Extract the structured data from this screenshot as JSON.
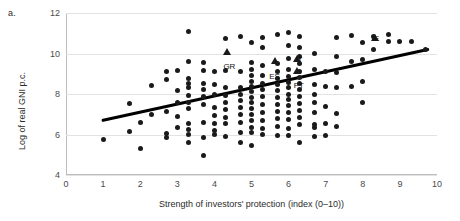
{
  "panel": {
    "label": "a."
  },
  "chart_data": {
    "type": "scatter",
    "title": "",
    "xlabel": "Strength of investors' protection (index (0–10))",
    "ylabel": "Log of real GNI p.c.",
    "xlim": [
      0,
      10
    ],
    "ylim": [
      4,
      12
    ],
    "xticks": [
      "0",
      "1",
      "2",
      "3",
      "4",
      "5",
      "6",
      "7",
      "8",
      "9",
      "10"
    ],
    "yticks": [
      "4",
      "6",
      "8",
      "10",
      "12"
    ],
    "grid": "horizontal",
    "legend": "none",
    "series": [
      {
        "name": "countries",
        "marker": "circle",
        "color": "#1a1a1a",
        "points": [
          [
            1.0,
            5.75
          ],
          [
            1.7,
            6.15
          ],
          [
            1.7,
            7.55
          ],
          [
            2.0,
            5.3
          ],
          [
            2.3,
            8.4
          ],
          [
            2.7,
            8.7
          ],
          [
            2.7,
            6.05
          ],
          [
            2.7,
            5.85
          ],
          [
            3.0,
            9.15
          ],
          [
            3.0,
            7.6
          ],
          [
            3.0,
            6.9
          ],
          [
            3.0,
            6.35
          ],
          [
            3.3,
            11.1
          ],
          [
            3.3,
            9.6
          ],
          [
            3.3,
            8.75
          ],
          [
            3.3,
            8.5
          ],
          [
            3.3,
            8.3
          ],
          [
            3.3,
            7.95
          ],
          [
            3.3,
            7.6
          ],
          [
            3.3,
            7.3
          ],
          [
            3.3,
            6.55
          ],
          [
            3.3,
            6.25
          ],
          [
            3.3,
            6.0
          ],
          [
            3.7,
            9.15
          ],
          [
            3.7,
            8.5
          ],
          [
            3.7,
            8.2
          ],
          [
            3.7,
            7.9
          ],
          [
            3.7,
            7.5
          ],
          [
            3.7,
            6.6
          ],
          [
            3.7,
            5.85
          ],
          [
            3.7,
            4.95
          ],
          [
            4.0,
            8.45
          ],
          [
            4.0,
            8.0
          ],
          [
            4.0,
            7.35
          ],
          [
            4.0,
            6.95
          ],
          [
            4.0,
            6.55
          ],
          [
            4.0,
            6.2
          ],
          [
            4.0,
            6.0
          ],
          [
            4.3,
            10.75
          ],
          [
            4.3,
            9.15
          ],
          [
            4.3,
            8.3
          ],
          [
            4.3,
            7.95
          ],
          [
            4.3,
            7.6
          ],
          [
            4.3,
            7.25
          ],
          [
            4.3,
            6.85
          ],
          [
            4.3,
            6.55
          ],
          [
            4.7,
            10.85
          ],
          [
            4.7,
            9.1
          ],
          [
            4.7,
            8.3
          ],
          [
            4.7,
            8.0
          ],
          [
            4.7,
            7.7
          ],
          [
            4.7,
            7.35
          ],
          [
            4.7,
            7.0
          ],
          [
            4.7,
            6.6
          ],
          [
            5.0,
            10.55
          ],
          [
            5.0,
            9.55
          ],
          [
            5.0,
            9.2
          ],
          [
            5.0,
            8.9
          ],
          [
            5.0,
            8.6
          ],
          [
            5.0,
            8.35
          ],
          [
            5.0,
            8.1
          ],
          [
            5.0,
            7.85
          ],
          [
            5.0,
            7.6
          ],
          [
            5.0,
            7.3
          ],
          [
            5.0,
            7.0
          ],
          [
            5.0,
            6.7
          ],
          [
            5.0,
            6.35
          ],
          [
            5.0,
            6.1
          ],
          [
            5.3,
            10.3
          ],
          [
            5.3,
            9.4
          ],
          [
            5.3,
            8.9
          ],
          [
            5.3,
            8.5
          ],
          [
            5.3,
            8.2
          ],
          [
            5.3,
            7.9
          ],
          [
            5.3,
            7.5
          ],
          [
            5.3,
            7.1
          ],
          [
            5.3,
            6.7
          ],
          [
            5.3,
            6.3
          ],
          [
            5.3,
            6.0
          ],
          [
            5.7,
            10.95
          ],
          [
            5.7,
            9.5
          ],
          [
            5.7,
            9.1
          ],
          [
            5.7,
            8.75
          ],
          [
            5.7,
            8.45
          ],
          [
            5.7,
            8.15
          ],
          [
            5.7,
            7.85
          ],
          [
            5.7,
            7.5
          ],
          [
            5.7,
            7.15
          ],
          [
            5.7,
            6.8
          ],
          [
            5.7,
            6.4
          ],
          [
            6.0,
            10.4
          ],
          [
            6.0,
            9.75
          ],
          [
            6.0,
            9.2
          ],
          [
            6.0,
            8.85
          ],
          [
            6.0,
            8.55
          ],
          [
            6.0,
            8.3
          ],
          [
            6.0,
            8.0
          ],
          [
            6.0,
            7.75
          ],
          [
            6.0,
            7.45
          ],
          [
            6.0,
            7.1
          ],
          [
            6.0,
            6.75
          ],
          [
            6.0,
            6.3
          ],
          [
            6.0,
            5.95
          ],
          [
            6.3,
            10.85
          ],
          [
            6.3,
            10.3
          ],
          [
            6.3,
            9.5
          ],
          [
            6.3,
            9.1
          ],
          [
            6.3,
            8.8
          ],
          [
            6.3,
            8.5
          ],
          [
            6.3,
            8.2
          ],
          [
            6.3,
            7.9
          ],
          [
            6.3,
            7.55
          ],
          [
            6.3,
            7.2
          ],
          [
            6.3,
            6.85
          ],
          [
            6.3,
            6.5
          ],
          [
            6.3,
            5.6
          ],
          [
            6.7,
            10.0
          ],
          [
            6.7,
            9.2
          ],
          [
            6.7,
            8.45
          ],
          [
            6.7,
            8.0
          ],
          [
            6.7,
            7.6
          ],
          [
            6.7,
            7.1
          ],
          [
            6.7,
            6.5
          ],
          [
            6.7,
            6.35
          ],
          [
            7.0,
            9.1
          ],
          [
            7.0,
            8.35
          ],
          [
            7.0,
            7.4
          ],
          [
            7.0,
            6.55
          ],
          [
            7.3,
            10.8
          ],
          [
            7.3,
            9.85
          ],
          [
            7.3,
            9.05
          ],
          [
            7.3,
            8.3
          ],
          [
            7.3,
            7.05
          ],
          [
            7.7,
            10.9
          ],
          [
            7.7,
            9.6
          ],
          [
            7.7,
            8.35
          ],
          [
            8.0,
            10.55
          ],
          [
            8.0,
            9.7
          ],
          [
            8.0,
            8.6
          ],
          [
            8.3,
            10.85
          ],
          [
            8.3,
            10.2
          ],
          [
            8.7,
            10.95
          ],
          [
            8.7,
            10.6
          ],
          [
            9.0,
            10.6
          ],
          [
            9.3,
            10.6
          ],
          [
            9.7,
            10.2
          ],
          [
            2.3,
            7.0
          ],
          [
            2.7,
            7.15
          ],
          [
            4.3,
            5.9
          ],
          [
            4.7,
            6.1
          ],
          [
            5.7,
            5.95
          ],
          [
            6.7,
            5.9
          ],
          [
            7.0,
            5.95
          ],
          [
            3.0,
            8.15
          ],
          [
            3.7,
            9.55
          ],
          [
            4.0,
            9.1
          ],
          [
            5.3,
            10.8
          ],
          [
            6.0,
            11.05
          ],
          [
            2.0,
            6.6
          ],
          [
            3.3,
            5.6
          ],
          [
            4.7,
            5.6
          ],
          [
            5.0,
            5.45
          ],
          [
            6.3,
            9.85
          ],
          [
            7.3,
            6.4
          ],
          [
            8.0,
            7.6
          ],
          [
            2.7,
            9.1
          ]
        ]
      },
      {
        "name": "labelled-countries",
        "marker": "triangle",
        "color": "#1a1a1a",
        "points": [
          {
            "code": "GR",
            "x": 4.35,
            "y": 10.05,
            "label_dx": 2,
            "label_dy": 10
          },
          {
            "code": "ES",
            "x": 5.62,
            "y": 9.65,
            "label_dx": 0,
            "label_dy": 11
          },
          {
            "code": "IT",
            "x": 6.22,
            "y": 9.75,
            "label_dx": 2,
            "label_dy": -4
          },
          {
            "code": "PT",
            "x": 6.22,
            "y": 9.15,
            "label_dx": 2,
            "label_dy": 10
          },
          {
            "code": "IE",
            "x": 8.32,
            "y": 10.75,
            "label_dx": 1,
            "label_dy": -4
          }
        ]
      }
    ],
    "trendline": {
      "name": "fitted-regression-line",
      "color": "#000000",
      "width_px": 3,
      "x0": 1.0,
      "y0": 6.7,
      "x1": 9.75,
      "y1": 10.2
    }
  }
}
